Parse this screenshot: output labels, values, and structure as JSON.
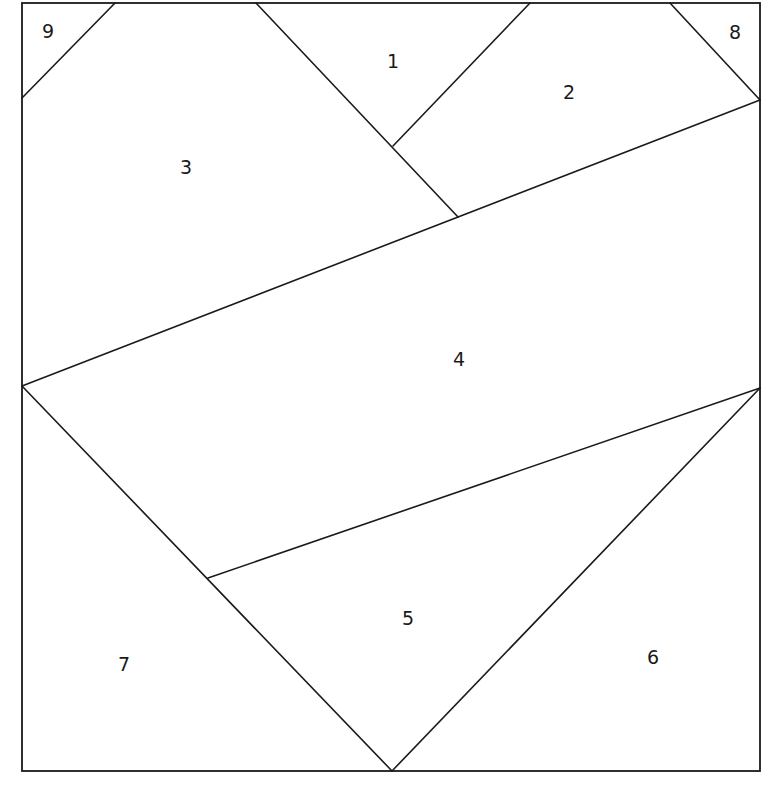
{
  "diagram": {
    "type": "foundation-paper-piecing-pattern",
    "stroke_color": "#1a1a1a",
    "background": "#ffffff",
    "frame": {
      "x1": 22,
      "y1": 3,
      "x2": 760,
      "y2": 771
    },
    "pieces": [
      {
        "id": "1",
        "label": "1",
        "x": 393,
        "y": 62
      },
      {
        "id": "2",
        "label": "2",
        "x": 569,
        "y": 93
      },
      {
        "id": "3",
        "label": "3",
        "x": 186,
        "y": 168
      },
      {
        "id": "4",
        "label": "4",
        "x": 459,
        "y": 360
      },
      {
        "id": "5",
        "label": "5",
        "x": 408,
        "y": 619
      },
      {
        "id": "6",
        "label": "6",
        "x": 653,
        "y": 658
      },
      {
        "id": "7",
        "label": "7",
        "x": 124,
        "y": 665
      },
      {
        "id": "8",
        "label": "8",
        "x": 735,
        "y": 33
      },
      {
        "id": "9",
        "label": "9",
        "x": 48,
        "y": 32
      }
    ],
    "seams": [
      {
        "name": "seam-9",
        "x1": 115,
        "y1": 3,
        "x2": 22,
        "y2": 98
      },
      {
        "name": "seam-8",
        "x1": 670,
        "y1": 3,
        "x2": 760,
        "y2": 100
      },
      {
        "name": "seam-3-1",
        "x1": 256,
        "y1": 3,
        "x2": 458,
        "y2": 217
      },
      {
        "name": "seam-1-2",
        "x1": 530,
        "y1": 3,
        "x2": 393,
        "y2": 146
      },
      {
        "name": "seam-4-top",
        "x1": 22,
        "y1": 386,
        "x2": 760,
        "y2": 100
      },
      {
        "name": "seam-4-bottom",
        "x1": 208,
        "y1": 578,
        "x2": 760,
        "y2": 388
      },
      {
        "name": "seam-left-diagonal",
        "x1": 22,
        "y1": 386,
        "x2": 392,
        "y2": 771
      },
      {
        "name": "seam-right-diagonal",
        "x1": 760,
        "y1": 388,
        "x2": 392,
        "y2": 771
      }
    ]
  }
}
